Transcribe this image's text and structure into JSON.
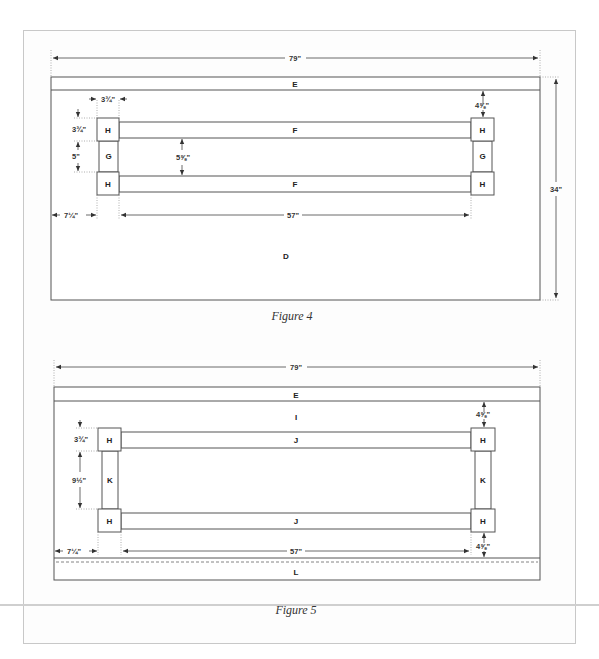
{
  "figures": [
    {
      "caption": "Figure 4",
      "overall_width": "79\"",
      "overall_height": "34\"",
      "parts": {
        "top_strip": "E",
        "rails": [
          "F",
          "F"
        ],
        "corner_blocks": [
          "H",
          "H",
          "H",
          "H"
        ],
        "stiles": [
          "G",
          "G"
        ],
        "panel": "D"
      },
      "dimensions": {
        "block_width": "3¾\"",
        "block_height": "3¾\"",
        "stile_height": "5\"",
        "rail_gap": "5⅝\"",
        "top_offset": "4⅝\"",
        "side_offset": "7¼\"",
        "inner_length": "57\""
      }
    },
    {
      "caption": "Figure 5",
      "overall_width": "79\"",
      "parts": {
        "top_strip": "E",
        "upper_panel": "I",
        "rails": [
          "J",
          "J"
        ],
        "corner_blocks": [
          "H",
          "H",
          "H",
          "H"
        ],
        "stiles": [
          "K",
          "K"
        ],
        "bottom_strip": "L"
      },
      "dimensions": {
        "block_height": "3¾\"",
        "stile_height": "9½\"",
        "top_offset": "4⅝\"",
        "bottom_offset": "4⅝\"",
        "side_offset": "7¼\"",
        "inner_length": "57\""
      }
    }
  ]
}
